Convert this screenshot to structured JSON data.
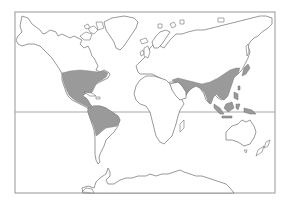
{
  "map": {
    "type": "world-outline-map",
    "projection": "cylindrical",
    "colors": {
      "background": "#ffffff",
      "land_fill": "#ffffff",
      "coastline": "#6f6f6f",
      "shaded_region": "#9a9a9a",
      "frame": "#a8a8a8",
      "equator": "#a8a8a8"
    },
    "reference_lines": [
      "equator"
    ],
    "shaded_regions": [
      "Eastern and central United States",
      "Mexico and Central America",
      "Northern South America",
      "Middle East to East Asia band",
      "Indian subcontinent",
      "Southeast Asia and Maritime islands",
      "Japan"
    ]
  }
}
